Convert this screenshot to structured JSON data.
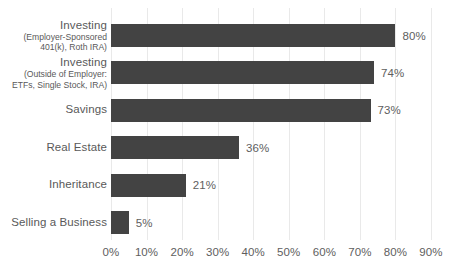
{
  "chart_data": {
    "type": "bar",
    "orientation": "horizontal",
    "title": "",
    "xlabel": "",
    "ylabel": "",
    "xlim": [
      0,
      90
    ],
    "xticks": [
      "0%",
      "10%",
      "20%",
      "30%",
      "40%",
      "50%",
      "60%",
      "70%",
      "80%",
      "90%"
    ],
    "xtick_values": [
      0,
      10,
      20,
      30,
      40,
      50,
      60,
      70,
      80,
      90
    ],
    "grid": "vertical",
    "legend": "none",
    "bar_color": "#434343",
    "gridline_color": "#e9e9e9",
    "label_color": "#595959",
    "categories": [
      "Investing (Employer-Sponsored 401(k), Roth IRA)",
      "Investing (Outside of Employer: ETFs, Single Stock, IRA)",
      "Savings",
      "Real Estate",
      "Inheritance",
      "Selling a Business"
    ],
    "values": [
      80,
      74,
      73,
      36,
      21,
      5
    ],
    "value_labels": [
      "80%",
      "74%",
      "73%",
      "36%",
      "21%",
      "5%"
    ],
    "bars": [
      {
        "label_line1": "Investing",
        "label_line2": "(Employer-Sponsored",
        "label_line3": "401(k), Roth IRA)",
        "value": 80,
        "value_label": "80%"
      },
      {
        "label_line1": "Investing",
        "label_line2": "(Outside of Employer:",
        "label_line3": "ETFs, Single Stock, IRA)",
        "value": 74,
        "value_label": "74%"
      },
      {
        "label_line1": "Savings",
        "label_line2": "",
        "label_line3": "",
        "value": 73,
        "value_label": "73%"
      },
      {
        "label_line1": "Real Estate",
        "label_line2": "",
        "label_line3": "",
        "value": 36,
        "value_label": "36%"
      },
      {
        "label_line1": "Inheritance",
        "label_line2": "",
        "label_line3": "",
        "value": 21,
        "value_label": "21%"
      },
      {
        "label_line1": "Selling a Business",
        "label_line2": "",
        "label_line3": "",
        "value": 5,
        "value_label": "5%"
      }
    ]
  }
}
